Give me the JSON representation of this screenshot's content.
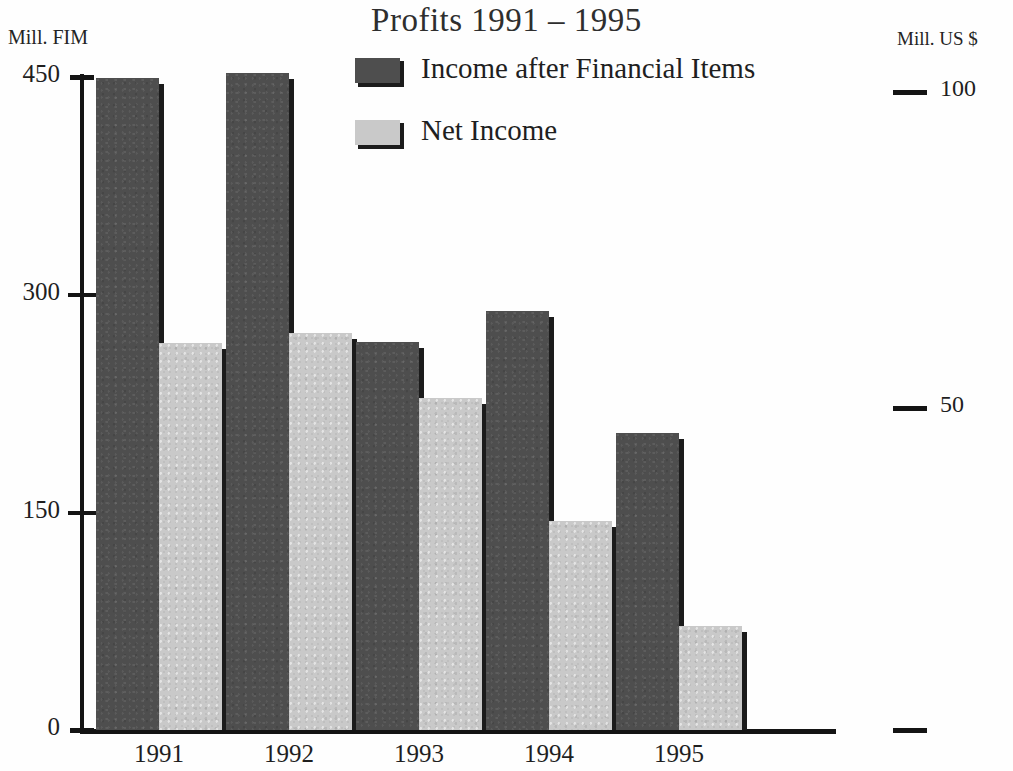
{
  "chart_data": {
    "type": "bar",
    "title": "Profits 1991 – 1995",
    "xlabel": "",
    "ylabel": "Mill. FIM",
    "y2label": "Mill. US $",
    "categories": [
      "1991",
      "1992",
      "1993",
      "1994",
      "1995"
    ],
    "series": [
      {
        "name": "Income after Financial Items",
        "color": "#4e4e4e",
        "values": [
          449,
          453,
          267,
          289,
          205
        ]
      },
      {
        "name": "Net Income",
        "color": "#c9c9c9",
        "values": [
          267,
          274,
          229,
          144,
          72
        ]
      }
    ],
    "ylim": [
      0,
      450
    ],
    "yticks": [
      0,
      150,
      300,
      450
    ],
    "ytick_labels": [
      "0",
      "150",
      "300",
      "450"
    ],
    "y2lim": [
      0,
      103
    ],
    "y2ticks": [
      50,
      100
    ],
    "y2tick_labels": [
      "50",
      "100"
    ],
    "grid": false,
    "legend_position": "top-center"
  },
  "axes": {
    "left_title": "Mill. FIM",
    "right_title": "Mill. US $",
    "left_ticks": [
      {
        "label": "450",
        "y": 77
      },
      {
        "label": "300",
        "y": 295
      },
      {
        "label": "150",
        "y": 513
      },
      {
        "label": "0",
        "y": 730
      }
    ],
    "right_ticks": [
      {
        "label": "100",
        "y": 92
      },
      {
        "label": "50",
        "y": 408
      },
      {
        "label": "",
        "y": 730
      }
    ]
  },
  "legend": {
    "items": [
      {
        "label": "Income after Financial Items",
        "swatch": "dark-swatch-icon"
      },
      {
        "label": "Net Income",
        "swatch": "light-swatch-icon"
      }
    ]
  },
  "bars": [
    {
      "category": "1991",
      "series": "Income after Financial Items",
      "value": 449,
      "x": 96,
      "top": 78,
      "width": 63,
      "tone": "dark"
    },
    {
      "category": "1991",
      "series": "Net Income",
      "value": 267,
      "x": 159,
      "top": 343,
      "width": 63,
      "tone": "light"
    },
    {
      "category": "1992",
      "series": "Income after Financial Items",
      "value": 453,
      "x": 226,
      "top": 73,
      "width": 63,
      "tone": "dark"
    },
    {
      "category": "1992",
      "series": "Net Income",
      "value": 274,
      "x": 289,
      "top": 333,
      "width": 63,
      "tone": "light"
    },
    {
      "category": "1993",
      "series": "Income after Financial Items",
      "value": 267,
      "x": 356,
      "top": 342,
      "width": 63,
      "tone": "dark"
    },
    {
      "category": "1993",
      "series": "Net Income",
      "value": 229,
      "x": 419,
      "top": 398,
      "width": 63,
      "tone": "light"
    },
    {
      "category": "1994",
      "series": "Income after Financial Items",
      "value": 289,
      "x": 486,
      "top": 311,
      "width": 63,
      "tone": "dark"
    },
    {
      "category": "1994",
      "series": "Net Income",
      "value": 144,
      "x": 549,
      "top": 521,
      "width": 63,
      "tone": "light"
    },
    {
      "category": "1995",
      "series": "Income after Financial Items",
      "value": 205,
      "x": 616,
      "top": 433,
      "width": 63,
      "tone": "dark"
    },
    {
      "category": "1995",
      "series": "Net Income",
      "value": 72,
      "x": 679,
      "top": 626,
      "width": 63,
      "tone": "light"
    }
  ],
  "x_labels": [
    {
      "label": "1991",
      "x": 94
    },
    {
      "label": "1992",
      "x": 224
    },
    {
      "label": "1993",
      "x": 354
    },
    {
      "label": "1994",
      "x": 484
    },
    {
      "label": "1995",
      "x": 614
    }
  ]
}
